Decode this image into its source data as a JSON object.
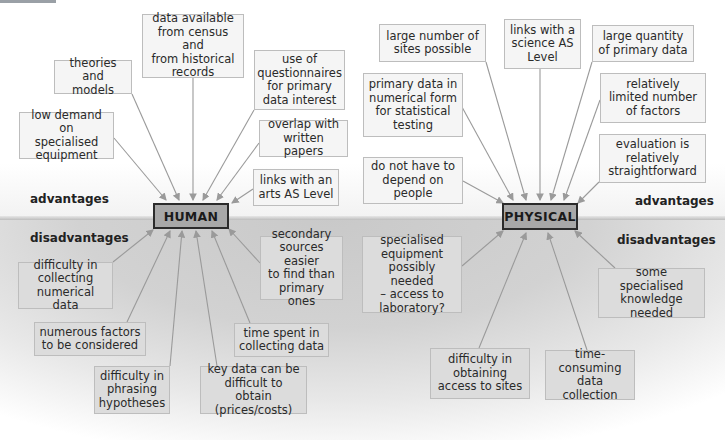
{
  "diagram": {
    "central_nodes": {
      "human": "HUMAN",
      "physical": "PHYSICAL"
    },
    "labels": {
      "left_advantages": "advantages",
      "left_disadvantages": "disadvantages",
      "right_advantages": "advantages",
      "right_disadvantages": "disadvantages"
    },
    "human": {
      "advantages": [
        "low demand on\nspecialised\nequipment",
        "theories and\nmodels",
        "data available\nfrom census and\nfrom historical\nrecords",
        "use of\nquestionnaires\nfor primary\ndata interest",
        "overlap with\nwritten papers",
        "links with an\narts AS Level"
      ],
      "disadvantages": [
        "difficulty in\ncollecting\nnumerical data",
        "numerous factors\nto be considered",
        "difficulty in\nphrasing\nhypotheses",
        "key data can be\ndifficult to obtain\n(prices/costs)",
        "time spent in\ncollecting data",
        "secondary\nsources easier\nto find than\nprimary ones"
      ]
    },
    "physical": {
      "advantages": [
        "do not have to\ndepend on\npeople",
        "primary data in\nnumerical form\nfor statistical\ntesting",
        "large number of\nsites possible",
        "links with a\nscience AS\nLevel",
        "large quantity\nof primary data",
        "relatively\nlimited number\nof factors",
        "evaluation is\nrelatively\nstraightforward"
      ],
      "disadvantages": [
        "specialised\nequipment\npossibly needed\n– access to\nlaboratory?",
        "difficulty in\nobtaining\naccess to sites",
        "time-\nconsuming\ndata collection",
        "some specialised\nknowledge\nneeded"
      ]
    },
    "colors": {
      "central_fill": "#a8a8a8",
      "advantage_box": "#f5f5f5",
      "disadvantage_box": "#dcdcdc",
      "arrow": "#9a9a9a"
    }
  }
}
